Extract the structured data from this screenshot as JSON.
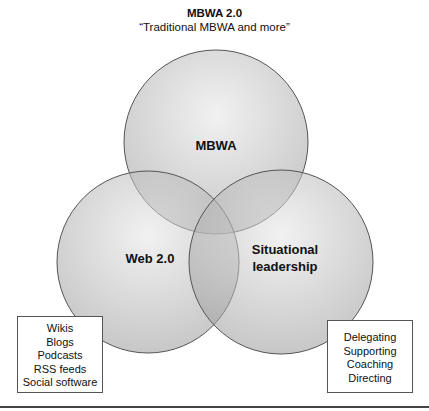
{
  "title": "MBWA 2.0",
  "subtitle": "“Traditional MBWA and more”",
  "circles": [
    {
      "label": "MBWA"
    },
    {
      "label": "Web 2.0"
    },
    {
      "label_line1": "Situational",
      "label_line2": "leadership"
    }
  ],
  "boxes": {
    "web20": [
      "Wikis",
      "Blogs",
      "Podcasts",
      "RSS feeds",
      "Social software"
    ],
    "situational": [
      "Delegating",
      "Supporting",
      "Coaching",
      "Directing"
    ]
  },
  "colors": {
    "circle_fill": "#d6d6d6",
    "circle_stroke": "#555555"
  }
}
